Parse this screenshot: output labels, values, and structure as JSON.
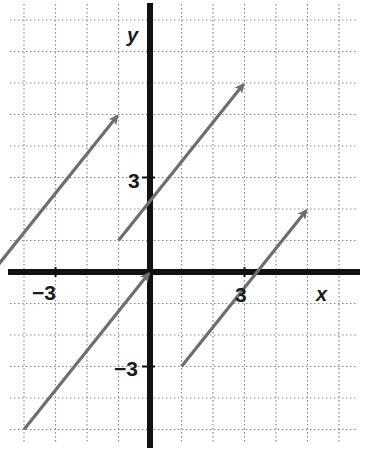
{
  "chart_data": {
    "type": "vector-plot",
    "title": "",
    "xlabel": "x",
    "ylabel": "y",
    "xlim": [
      -4.5,
      6.6
    ],
    "ylim": [
      -5.5,
      8.5
    ],
    "grid": true,
    "grid_step": 1,
    "tick_labels": {
      "x": [
        {
          "value": -3,
          "label": "−3"
        },
        {
          "value": 3,
          "label": "3"
        }
      ],
      "y": [
        {
          "value": 3,
          "label": "3"
        },
        {
          "value": -3,
          "label": "−3"
        }
      ]
    },
    "vectors": [
      {
        "name": "vector-a",
        "tail": [
          -5,
          0
        ],
        "head": [
          -1,
          5
        ],
        "displacement": [
          4,
          5
        ]
      },
      {
        "name": "vector-b",
        "tail": [
          -1,
          1
        ],
        "head": [
          3,
          6
        ],
        "displacement": [
          4,
          5
        ]
      },
      {
        "name": "vector-c",
        "tail": [
          -4,
          -5
        ],
        "head": [
          0,
          0
        ],
        "displacement": [
          4,
          5
        ]
      },
      {
        "name": "vector-d",
        "tail": [
          1,
          -3
        ],
        "head": [
          5,
          2
        ],
        "displacement": [
          4,
          5
        ]
      }
    ],
    "colors": {
      "vector": "#6e6e6e",
      "axis": "#111111",
      "grid": "#8a8a8a"
    }
  },
  "labels": {
    "x_axis": "x",
    "y_axis": "y",
    "x_neg3": "−3",
    "x_pos3": "3",
    "y_pos3": "3",
    "y_neg3": "−3"
  }
}
